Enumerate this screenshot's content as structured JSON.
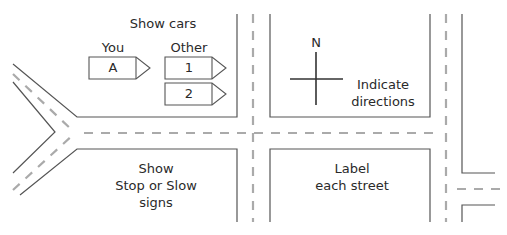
{
  "diagram": {
    "title_annotation": "Show cars",
    "legend": {
      "you_label": "You",
      "other_label": "Other",
      "cars": [
        {
          "id": "A",
          "group": "you"
        },
        {
          "id": "1",
          "group": "other"
        },
        {
          "id": "2",
          "group": "other"
        }
      ]
    },
    "compass": {
      "north_label": "N"
    },
    "instructions": {
      "directions": [
        "Indicate",
        "directions"
      ],
      "signs": [
        "Show",
        "Stop or Slow",
        "signs"
      ],
      "streets": [
        "Label",
        "each street"
      ]
    },
    "colors": {
      "curb_line": "#555555",
      "center_dash": "#aaaaaa",
      "text": "#2a2a2a"
    }
  }
}
